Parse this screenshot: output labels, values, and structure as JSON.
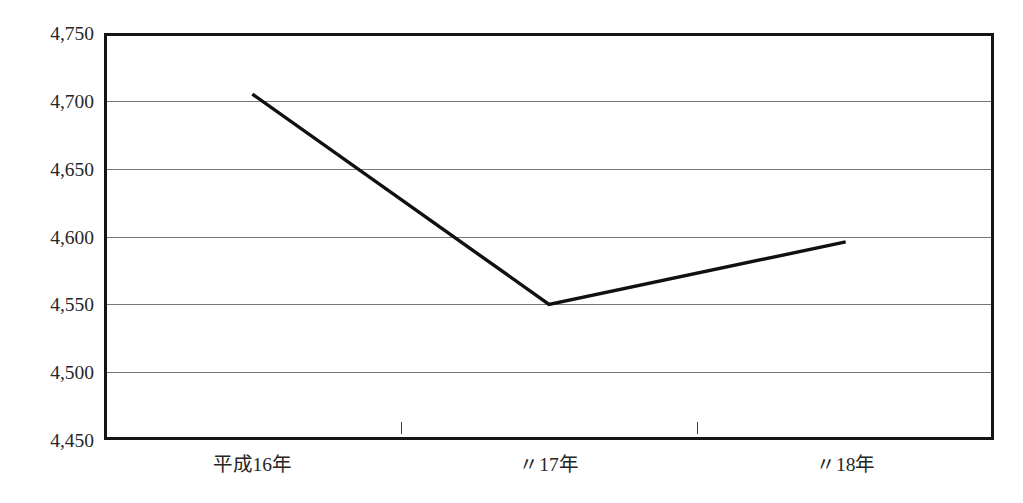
{
  "chart_data": {
    "type": "line",
    "title": "",
    "xlabel": "",
    "ylabel": "",
    "categories": [
      "平成16年",
      "〃17年",
      "〃18年"
    ],
    "series": [
      {
        "name": "",
        "values": [
          4705,
          4550,
          4596
        ]
      }
    ],
    "ylim": [
      4450,
      4750
    ],
    "ytick_step": 50,
    "ytick_labels": [
      "4,750",
      "4,700",
      "4,650",
      "4,600",
      "4,550",
      "4,500",
      "4,450"
    ],
    "ytick_values": [
      4750,
      4700,
      4650,
      4600,
      4550,
      4500,
      4450
    ],
    "grid": true,
    "legend": false,
    "legend_position": "none",
    "line_color": "#101010",
    "grid_color": "#777777",
    "frame_color": "#151515",
    "background_color": "#ffffff"
  },
  "figure": {
    "title_remnant": "",
    "y_axis_name": "y-axis",
    "x_axis_name": "x-axis"
  }
}
